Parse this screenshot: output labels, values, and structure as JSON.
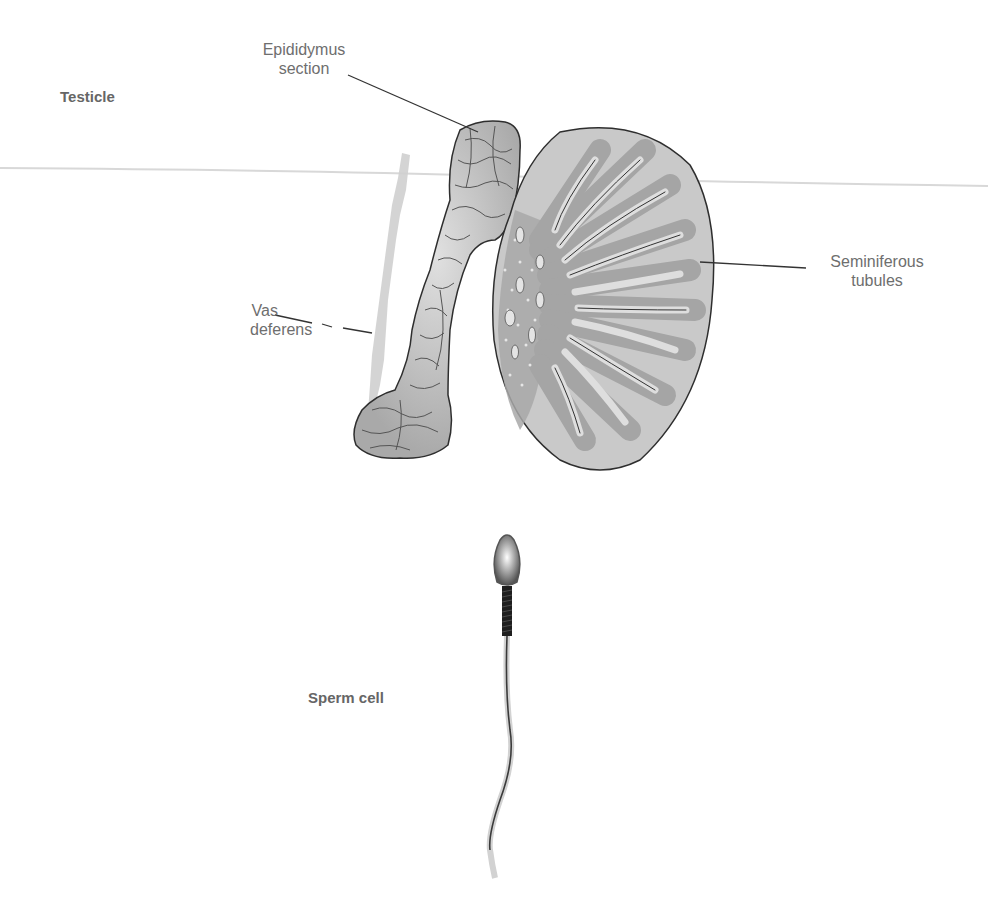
{
  "diagram": {
    "section_titles": {
      "testicle": "Testicle",
      "sperm_cell": "Sperm cell"
    },
    "labels": {
      "epididymus_line1": "Epididymus",
      "epididymus_line2": "section",
      "seminiferous_line1": "Seminiferous",
      "seminiferous_line2": "tubules",
      "vas_line1": "Vas",
      "vas_line2": "deferens"
    },
    "colors": {
      "background": "#ffffff",
      "label_text": "#6e6e6e",
      "testis_fill": "#c9c9c9",
      "tubule_dark": "#a8a8a8",
      "tubule_light": "#dcdcdc",
      "epididymus_fill": "#b5b5b5",
      "vas_fill": "#cfcfcf",
      "outline": "#333333"
    }
  }
}
